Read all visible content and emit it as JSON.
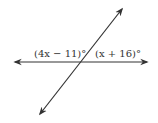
{
  "diagram": {
    "type": "intersecting-lines",
    "labels": {
      "left_angle": "(4x − 11)°",
      "right_angle": "(x + 16)°"
    },
    "colors": {
      "line": "#333333",
      "text": "#333333"
    }
  }
}
